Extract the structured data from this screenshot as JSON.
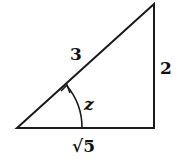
{
  "diagram": {
    "type": "right-triangle",
    "hypotenuse_label": "3",
    "opposite_label": "2",
    "adjacent_label": "√5",
    "angle_label": "z",
    "vertices": {
      "bottom_left": [
        17,
        128
      ],
      "bottom_right": [
        154,
        128
      ],
      "top": [
        154,
        4
      ]
    },
    "stroke_color": "#1a1a1a"
  }
}
